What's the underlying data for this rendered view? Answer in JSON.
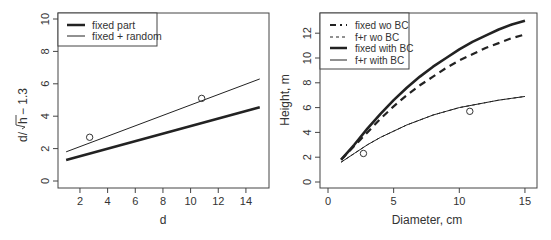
{
  "chart_data": [
    {
      "type": "line",
      "title": "",
      "xlabel": "d",
      "ylabel": "d/√h−1.3",
      "xlim": [
        1,
        15
      ],
      "ylim": [
        0,
        10
      ],
      "x_ticks": [
        "2",
        "4",
        "6",
        "8",
        "10",
        "12",
        "14"
      ],
      "y_ticks": [
        "0",
        "2",
        "4",
        "6",
        "8",
        "10"
      ],
      "grid": false,
      "legend_position": "topleft",
      "series": [
        {
          "name": "fixed part",
          "style": "thick solid",
          "x": [
            1,
            15
          ],
          "y": [
            1.3,
            4.55
          ]
        },
        {
          "name": "fixed + random",
          "style": "thin solid",
          "x": [
            1,
            15
          ],
          "y": [
            1.8,
            6.3
          ]
        }
      ],
      "points": [
        {
          "x": 2.7,
          "y": 2.7
        },
        {
          "x": 10.8,
          "y": 5.1
        }
      ]
    },
    {
      "type": "line",
      "title": "",
      "xlabel": "Diameter, cm",
      "ylabel": "Height, m",
      "xlim": [
        0,
        15
      ],
      "ylim": [
        0,
        13
      ],
      "x_ticks": [
        "0",
        "5",
        "10",
        "15"
      ],
      "y_ticks": [
        "0",
        "2",
        "4",
        "6",
        "8",
        "10",
        "12"
      ],
      "grid": false,
      "legend_position": "topleft",
      "series": [
        {
          "name": "fixed wo BC",
          "style": "thick dash-dot",
          "x": [
            1,
            2,
            3,
            4,
            5,
            6,
            7,
            8,
            9,
            10,
            11,
            12,
            13,
            14,
            15
          ],
          "y": [
            1.8,
            2.9,
            4.0,
            5.1,
            6.1,
            7.0,
            7.8,
            8.5,
            9.2,
            9.8,
            10.3,
            10.8,
            11.2,
            11.6,
            11.9
          ]
        },
        {
          "name": "f+r wo BC",
          "style": "thin dashed",
          "x": [
            1,
            2,
            3,
            4,
            5,
            6,
            7,
            8,
            9,
            10,
            11,
            12,
            13,
            14,
            15
          ],
          "y": [
            1.6,
            2.3,
            3.0,
            3.6,
            4.1,
            4.6,
            5.0,
            5.4,
            5.7,
            6.0,
            6.2,
            6.4,
            6.6,
            6.75,
            6.9
          ]
        },
        {
          "name": "fixed with BC",
          "style": "thick solid",
          "x": [
            1,
            2,
            3,
            4,
            5,
            6,
            7,
            8,
            9,
            10,
            11,
            12,
            13,
            14,
            15
          ],
          "y": [
            1.8,
            3.0,
            4.3,
            5.5,
            6.6,
            7.6,
            8.5,
            9.3,
            10.0,
            10.7,
            11.3,
            11.8,
            12.3,
            12.7,
            13.0
          ]
        },
        {
          "name": "f+r with BC",
          "style": "thin solid",
          "x": [
            1,
            2,
            3,
            4,
            5,
            6,
            7,
            8,
            9,
            10,
            11,
            12,
            13,
            14,
            15
          ],
          "y": [
            1.6,
            2.3,
            3.0,
            3.6,
            4.1,
            4.6,
            5.0,
            5.4,
            5.7,
            6.0,
            6.2,
            6.4,
            6.6,
            6.75,
            6.9
          ]
        }
      ],
      "points": [
        {
          "x": 2.7,
          "y": 2.3
        },
        {
          "x": 10.8,
          "y": 5.7
        }
      ]
    }
  ],
  "left": {
    "xlabel": "d",
    "ylabel_prefix": "d/",
    "ylabel_root": "h",
    "ylabel_suffix": "− 1.3",
    "legend": [
      "fixed part",
      "fixed + random"
    ]
  },
  "right": {
    "xlabel": "Diameter, cm",
    "ylabel": "Height, m",
    "legend": [
      "fixed wo BC",
      "f+r wo BC",
      "fixed with BC",
      "f+r with BC"
    ]
  },
  "colors": {
    "line": "#222222",
    "axis": "#444444",
    "text": "#333333"
  }
}
